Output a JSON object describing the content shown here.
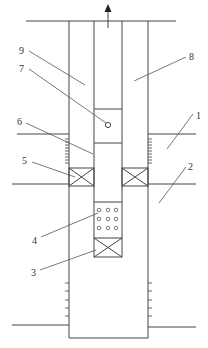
{
  "diagram": {
    "type": "wellbore-schematic",
    "flow_direction": "up",
    "colors": {
      "line": "#444444",
      "text": "#333333",
      "background": "#ffffff"
    },
    "labels": [
      {
        "id": "1",
        "text": "1",
        "x": 199,
        "y": 119
      },
      {
        "id": "2",
        "text": "2",
        "x": 191,
        "y": 170
      },
      {
        "id": "3",
        "text": "3",
        "x": 31,
        "y": 276
      },
      {
        "id": "4",
        "text": "4",
        "x": 32,
        "y": 244
      },
      {
        "id": "5",
        "text": "5",
        "x": 22,
        "y": 164
      },
      {
        "id": "6",
        "text": "6",
        "x": 17,
        "y": 125
      },
      {
        "id": "7",
        "text": "7",
        "x": 19,
        "y": 72
      },
      {
        "id": "8",
        "text": "8",
        "x": 189,
        "y": 60
      },
      {
        "id": "9",
        "text": "9",
        "x": 19,
        "y": 54
      }
    ],
    "components": {
      "1": "upper formation / pay zone",
      "2": "lower formation",
      "3": "bottom packer / plug",
      "4": "perforated screen section",
      "5": "packer",
      "6": "tubing",
      "7": "valve port",
      "8": "tubing bore",
      "9": "annulus"
    }
  }
}
